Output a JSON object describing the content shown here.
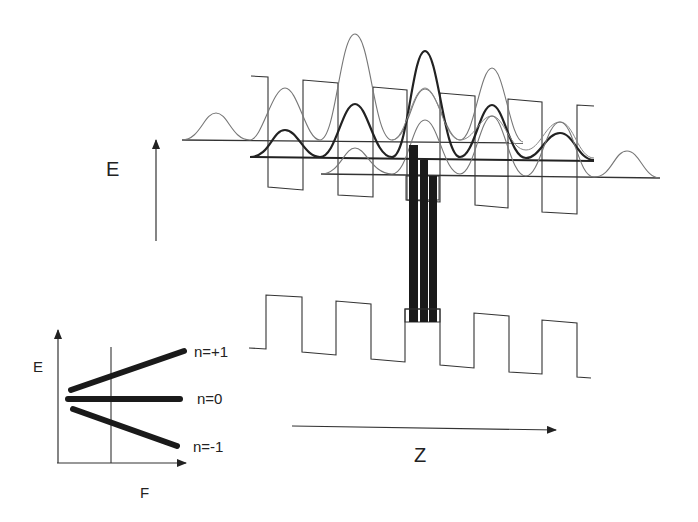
{
  "main_axes": {
    "energy_label": "E",
    "position_label": "Z"
  },
  "inset": {
    "y_label": "E",
    "x_label": "F",
    "levels": [
      {
        "label": "n=+1",
        "slope": "increasing"
      },
      {
        "label": "n=0",
        "slope": "flat"
      },
      {
        "label": "n=-1",
        "slope": "decreasing"
      }
    ]
  },
  "structure": {
    "conduction_band": "tilted superlattice square-well potential (upper)",
    "valence_band": "tilted superlattice square-well potential (lower)",
    "wavefunctions": [
      {
        "name": "n=-1 Wannier-Stark state",
        "weight": "thin",
        "baseline_y": 140
      },
      {
        "name": "n=0 Wannier-Stark state",
        "weight": "bold",
        "baseline_y": 158
      },
      {
        "name": "n=+1 Wannier-Stark state",
        "weight": "thin",
        "baseline_y": 175
      }
    ],
    "transitions": [
      "n=+1",
      "n=0",
      "n=-1"
    ]
  },
  "colors": {
    "line": "#333333",
    "light_line": "#777777",
    "bar": "#1a1a1a"
  }
}
